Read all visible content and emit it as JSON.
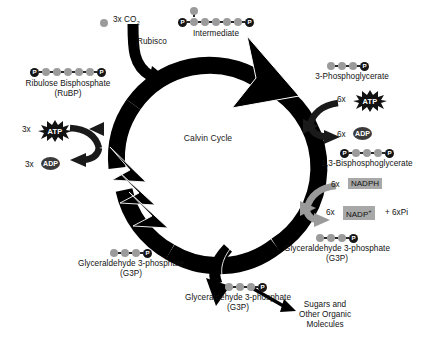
{
  "diagram": {
    "title": "Calvin Cycle",
    "center_label": "Calvin Cycle"
  },
  "inputs": {
    "co2_label": "3x CO",
    "co2_sub": "2",
    "enzyme_label": "Rubisco"
  },
  "molecules": {
    "rubp": {
      "name_line1": "Ribulose Bisphosphate",
      "name_line2": "(RuBP)",
      "carbons": 5,
      "phosphate_left": "P",
      "phosphate_right": "P",
      "branch": false
    },
    "intermediate": {
      "name_line1": "Intermediate",
      "name_line2": "",
      "carbons": 6,
      "phosphate_left": "P",
      "phosphate_right": "P",
      "branch": true
    },
    "pga": {
      "name_line1": "3-Phosphoglycerate",
      "name_line2": "",
      "carbons": 3,
      "phosphate_left": "",
      "phosphate_right": "P",
      "branch": false
    },
    "bpg": {
      "name_line1": "1,3-Bisphosphoglycerate",
      "name_line2": "",
      "carbons": 3,
      "phosphate_left": "P",
      "phosphate_right": "P",
      "branch": false
    },
    "g3p_right": {
      "name_line1": "Glyceraldehyde 3-phosphate",
      "name_line2": "(G3P)",
      "carbons": 3,
      "phosphate_right": "P"
    },
    "g3p_left": {
      "name_line1": "Glyceraldehyde 3-phosphate",
      "name_line2": "(G3P)",
      "carbons": 3,
      "phosphate_right": "P"
    },
    "g3p_exit": {
      "name_line1": "Glyceraldehyde 3-phosphate",
      "name_line2": "(G3P)",
      "carbons": 3,
      "phosphate_right": "P"
    }
  },
  "energy": {
    "atp_right_count": "6x",
    "atp_right_label": "ATP",
    "adp_right_count": "6x",
    "adp_right_label": "ADP",
    "atp_left_count": "3x",
    "atp_left_label": "ATP",
    "adp_left_count": "3x",
    "adp_left_label": "ADP",
    "nadph_count": "6x",
    "nadph_label": "NADPH",
    "nadp_count": "6x",
    "nadp_label": "NADP",
    "nadp_charge": "+",
    "pi_label": "+ 6xPi"
  },
  "output": {
    "line1": "Sugars and",
    "line2": "Other Organic",
    "line3": "Molecules"
  },
  "colors": {
    "ring": "#000000",
    "carbon": "#9b9b9b",
    "phosphate": "#151515",
    "nadph_box": "#a8a8a8",
    "gray_arrow": "#9a9a9a",
    "background": "#ffffff",
    "text": "#121212"
  }
}
